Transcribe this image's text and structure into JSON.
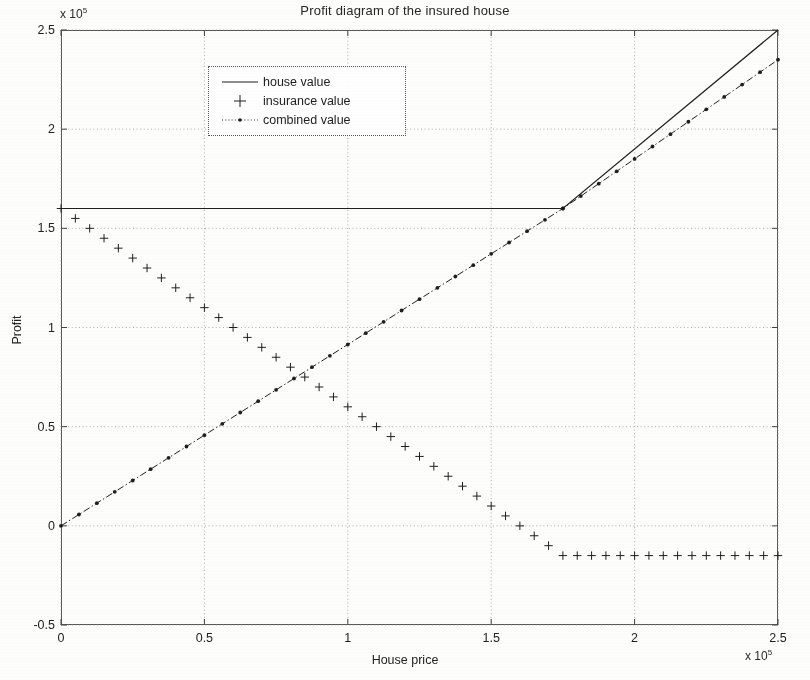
{
  "chart_data": {
    "type": "line",
    "title": "Profit diagram of the insured house",
    "xlabel": "House price",
    "ylabel": "Profit",
    "x_multiplier": "x 10",
    "x_multiplier_exp": "5",
    "y_multiplier": "x 10",
    "y_multiplier_exp": "5",
    "xlim": [
      0,
      250000
    ],
    "ylim": [
      -50000,
      250000
    ],
    "xticks": [
      0,
      50000,
      100000,
      150000,
      200000,
      250000
    ],
    "xtick_labels": [
      "0",
      "0.5",
      "1",
      "1.5",
      "2",
      "2.5"
    ],
    "yticks": [
      -50000,
      0,
      50000,
      100000,
      150000,
      200000,
      250000
    ],
    "ytick_labels": [
      "-0.5",
      "0",
      "0.5",
      "1",
      "1.5",
      "2",
      "2.5"
    ],
    "grid": true,
    "legend_position": "upper center",
    "annotations": {
      "house_value_cap": 160000,
      "insurance_premium": 15000,
      "breakpoint_x": 175000,
      "crossing_point": [
        80000,
        80000
      ]
    },
    "series": [
      {
        "name": "house value",
        "style": "solid-line",
        "marker": "none",
        "color": "#1f1f1f",
        "x": [
          0,
          175000,
          250000
        ],
        "y": [
          160000,
          160000,
          250000
        ]
      },
      {
        "name": "insurance value",
        "style": "markers-only",
        "marker": "plus",
        "color": "#1f1f1f",
        "x": [
          0,
          5000,
          10000,
          15000,
          20000,
          25000,
          30000,
          35000,
          40000,
          45000,
          50000,
          55000,
          60000,
          65000,
          70000,
          75000,
          80000,
          85000,
          90000,
          95000,
          100000,
          105000,
          110000,
          115000,
          120000,
          125000,
          130000,
          135000,
          140000,
          145000,
          150000,
          155000,
          160000,
          165000,
          170000,
          175000,
          180000,
          185000,
          190000,
          195000,
          200000,
          205000,
          210000,
          215000,
          220000,
          225000,
          230000,
          235000,
          240000,
          245000,
          250000
        ],
        "y": [
          160000,
          155000,
          150000,
          145000,
          140000,
          135000,
          130000,
          125000,
          120000,
          115000,
          110000,
          105000,
          100000,
          95000,
          90000,
          85000,
          80000,
          75000,
          70000,
          65000,
          60000,
          55000,
          50000,
          45000,
          40000,
          35000,
          30000,
          25000,
          20000,
          15000,
          10000,
          5000,
          0,
          -5000,
          -10000,
          -15000,
          -15000,
          -15000,
          -15000,
          -15000,
          -15000,
          -15000,
          -15000,
          -15000,
          -15000,
          -15000,
          -15000,
          -15000,
          -15000,
          -15000,
          -15000
        ]
      },
      {
        "name": "combined value",
        "style": "dash-dot-line",
        "marker": "dot",
        "color": "#1f1f1f",
        "x": [
          0,
          175000,
          250000
        ],
        "y": [
          0,
          160000,
          235000
        ]
      }
    ]
  },
  "legend": {
    "items": [
      {
        "label": "house value",
        "key": "solid-line"
      },
      {
        "label": "insurance value",
        "key": "plus-marker"
      },
      {
        "label": "combined value",
        "key": "dash-dot-marker"
      }
    ]
  }
}
